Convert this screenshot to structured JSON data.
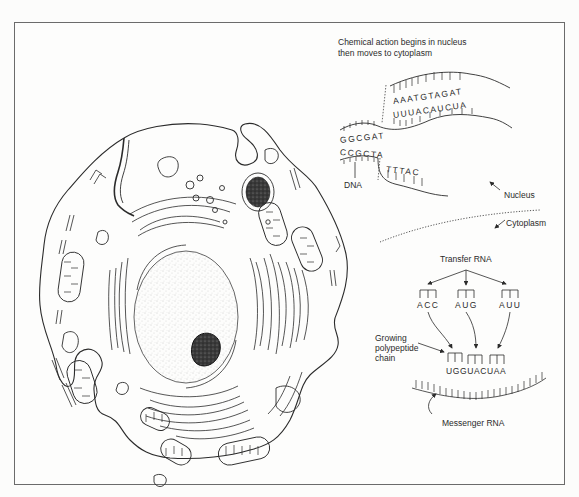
{
  "figure": {
    "title_line1": "Chemical action begins in nucleus",
    "title_line2": "then moves to cytoplasm",
    "colors": {
      "ink": "#2b2b2b",
      "frame": "#6b6b6b",
      "paper": "#fdfdfc",
      "nucleolus": "#1e1e1e",
      "stipple": "#9a9a9a"
    }
  },
  "dna": {
    "label": "DNA",
    "upper_strand_left": "GGCGAT",
    "lower_strand_left": "CCGCTA",
    "separated_upper": "AAATGTAGAT",
    "separated_mrna": "UUUACAUCUA",
    "separated_lower": "TTTAC"
  },
  "regions": {
    "nucleus_label": "Nucleus",
    "cytoplasm_label": "Cytoplasm"
  },
  "translation": {
    "trna_label": "Transfer RNA",
    "anticodons": [
      "ACC",
      "AUG",
      "AUU"
    ],
    "polypeptide_label_line1": "Growing",
    "polypeptide_label_line2": "polypeptide",
    "polypeptide_label_line3": "chain",
    "mrna_codons": "UGGUACUAA",
    "mrna_label": "Messenger RNA"
  },
  "cell": {
    "parts": [
      "cell-membrane",
      "nucleus",
      "nucleolus",
      "endoplasmic-reticulum",
      "mitochondria",
      "vacuoles",
      "lysosome"
    ]
  }
}
